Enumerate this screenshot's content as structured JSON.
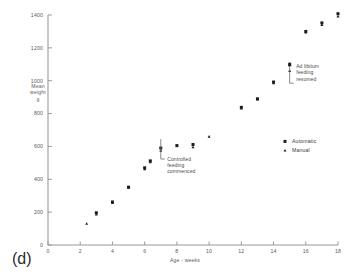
{
  "panel": {
    "label": "(d)"
  },
  "chart_data": {
    "type": "scatter",
    "title": "",
    "xlabel": "Age - weeks",
    "ylabel": "Mean weight g",
    "ylabel_lines": [
      "Mean",
      "weight",
      "g"
    ],
    "xlim": [
      0,
      18
    ],
    "ylim": [
      0,
      1400
    ],
    "xticks": [
      0,
      2,
      4,
      6,
      8,
      10,
      12,
      14,
      16,
      18
    ],
    "yticks": [
      0,
      200,
      400,
      600,
      800,
      1000,
      1200,
      1400
    ],
    "xtick_labels": [
      "0",
      "2",
      "4",
      "6",
      "8",
      "10",
      "12",
      "14",
      "16",
      "18"
    ],
    "ytick_labels": [
      "0",
      "200",
      "400",
      "600",
      "800",
      "1000",
      "1200",
      "1400"
    ],
    "grid": false,
    "legend_position": "right-middle",
    "series": [
      {
        "name": "Automatic",
        "marker": "square",
        "points": [
          {
            "x": 3.0,
            "y": 196
          },
          {
            "x": 4.0,
            "y": 262
          },
          {
            "x": 5.0,
            "y": 352
          },
          {
            "x": 6.0,
            "y": 470
          },
          {
            "x": 6.35,
            "y": 512
          },
          {
            "x": 7.0,
            "y": 590
          },
          {
            "x": 8.0,
            "y": 605
          },
          {
            "x": 9.0,
            "y": 612
          },
          {
            "x": 12.0,
            "y": 838
          },
          {
            "x": 13.0,
            "y": 890
          },
          {
            "x": 14.0,
            "y": 992
          },
          {
            "x": 15.0,
            "y": 1100
          },
          {
            "x": 16.0,
            "y": 1300
          },
          {
            "x": 17.0,
            "y": 1352
          },
          {
            "x": 18.0,
            "y": 1408
          }
        ]
      },
      {
        "name": "Manual",
        "marker": "triangle",
        "points": [
          {
            "x": 2.4,
            "y": 130
          },
          {
            "x": 3.0,
            "y": 186
          },
          {
            "x": 4.0,
            "y": 256
          },
          {
            "x": 5.0,
            "y": 350
          },
          {
            "x": 6.0,
            "y": 462
          },
          {
            "x": 6.35,
            "y": 505
          },
          {
            "x": 7.0,
            "y": 575
          },
          {
            "x": 9.0,
            "y": 596
          },
          {
            "x": 10.0,
            "y": 660
          },
          {
            "x": 12.0,
            "y": 832
          },
          {
            "x": 13.0,
            "y": 886
          },
          {
            "x": 14.0,
            "y": 985
          },
          {
            "x": 15.0,
            "y": 1060
          },
          {
            "x": 16.0,
            "y": 1294
          },
          {
            "x": 17.0,
            "y": 1340
          },
          {
            "x": 18.0,
            "y": 1392
          }
        ]
      }
    ],
    "annotations": [
      {
        "id": "controlled-feeding",
        "lines": [
          "Controlled",
          "feeding",
          "commenced"
        ],
        "target_x": 7.0,
        "target_y": 560
      },
      {
        "id": "ad-libitum",
        "lines": [
          "Ad libitum",
          "feeding",
          "resumed"
        ],
        "target_x": 15.0,
        "target_y": 1040
      }
    ],
    "legend": [
      {
        "label": "Automatic",
        "marker": "square"
      },
      {
        "label": "Manual",
        "marker": "triangle"
      }
    ]
  }
}
